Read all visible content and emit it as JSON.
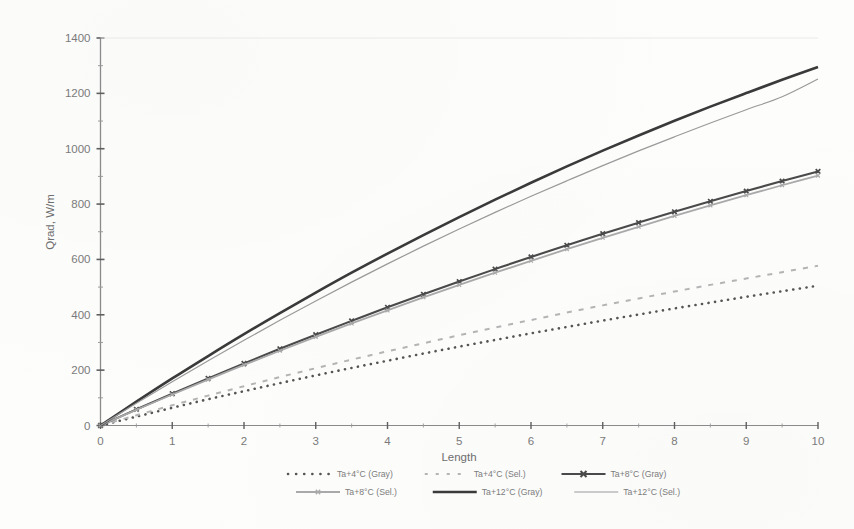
{
  "chart_data": {
    "type": "line",
    "title": "",
    "xlabel": "Length",
    "ylabel": "Qrad, W/m",
    "xlim": [
      0,
      10
    ],
    "ylim": [
      0,
      1400
    ],
    "xticks": [
      "0",
      "1",
      "2",
      "3",
      "4",
      "5",
      "6",
      "7",
      "8",
      "9",
      "10"
    ],
    "yticks": [
      "0",
      "200",
      "400",
      "600",
      "800",
      "1000",
      "1200",
      "1400"
    ],
    "x": [
      0,
      0.5,
      1,
      1.5,
      2,
      2.5,
      3,
      3.5,
      4,
      4.5,
      5,
      5.5,
      6,
      6.5,
      7,
      7.5,
      8,
      8.5,
      9,
      9.5,
      10
    ],
    "grid": false,
    "legend_position": "below-plot",
    "series": [
      {
        "name": "Ta+4°C (Gray)",
        "style": "dotted-thick",
        "color": "#555555",
        "values": [
          0,
          32,
          64,
          95,
          124,
          153,
          181,
          208,
          234,
          260,
          285,
          309,
          333,
          356,
          379,
          401,
          423,
          444,
          465,
          485,
          505
        ]
      },
      {
        "name": "Ta+4°C (Sel.)",
        "style": "dashed-light",
        "color": "#b4b4b4",
        "values": [
          0,
          37,
          73,
          108,
          142,
          175,
          207,
          238,
          268,
          297,
          326,
          354,
          381,
          408,
          434,
          459,
          484,
          508,
          531,
          554,
          577
        ]
      },
      {
        "name": "Ta+8°C (Gray)",
        "style": "marker-x-line",
        "color": "#4a4a4a",
        "values": [
          0,
          58,
          115,
          170,
          224,
          277,
          328,
          378,
          427,
          474,
          520,
          565,
          609,
          651,
          693,
          733,
          772,
          810,
          847,
          883,
          918
        ]
      },
      {
        "name": "Ta+8°C (Sel.)",
        "style": "marker-x-light",
        "color": "#a9a9a9",
        "values": [
          0,
          57,
          112,
          166,
          219,
          270,
          320,
          369,
          416,
          463,
          508,
          552,
          595,
          637,
          678,
          718,
          757,
          795,
          832,
          868,
          903
        ]
      },
      {
        "name": "Ta+12°C (Gray)",
        "style": "solid-thick",
        "color": "#3a3a3a",
        "values": [
          0,
          86,
          170,
          251,
          330,
          406,
          480,
          552,
          621,
          688,
          753,
          816,
          877,
          936,
          993,
          1048,
          1101,
          1152,
          1201,
          1249,
          1295
        ]
      },
      {
        "name": "Ta+12°C (Sel.)",
        "style": "solid-thin",
        "color": "#9a9a9a",
        "values": [
          0,
          80,
          158,
          234,
          308,
          380,
          450,
          518,
          584,
          648,
          710,
          770,
          828,
          884,
          939,
          992,
          1043,
          1093,
          1141,
          1188,
          1252
        ]
      }
    ]
  },
  "legend": {
    "row1": [
      {
        "label": "Ta+4°C (Gray)",
        "style": "dotted-thick"
      },
      {
        "label": "Ta+4°C (Sel.)",
        "style": "dashed-light"
      },
      {
        "label": "Ta+8°C (Gray)",
        "style": "marker-x-line"
      }
    ],
    "row2": [
      {
        "label": "Ta+8°C (Sel.)",
        "style": "marker-x-light"
      },
      {
        "label": "Ta+12°C (Gray)",
        "style": "solid-thick"
      },
      {
        "label": "Ta+12°C (Sel.)",
        "style": "solid-thin"
      }
    ]
  }
}
